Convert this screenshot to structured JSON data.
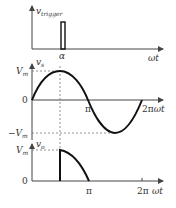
{
  "diagram": {
    "type": "waveform-timing-diagram",
    "panels": [
      {
        "id": "trigger",
        "ylabel": "v",
        "ylabel_sub": "trigger",
        "xlabel": "ωt",
        "pulse_label": "α"
      },
      {
        "id": "source",
        "ylabel": "v",
        "ylabel_sub": "s",
        "y_ticks": [
          "V",
          "0",
          "−V"
        ],
        "y_tick_sub": "m",
        "x_ticks": [
          "π",
          "2π"
        ],
        "xlabel": "ωt"
      },
      {
        "id": "output",
        "ylabel": "v",
        "ylabel_sub": "o",
        "y_ticks": [
          "V",
          "0"
        ],
        "y_tick_sub": "m",
        "x_ticks": [
          "π",
          "2π"
        ],
        "xlabel": "ωt"
      }
    ],
    "colors": {
      "curve": "#111111",
      "axis": "#444444",
      "dashed": "#777777"
    }
  }
}
